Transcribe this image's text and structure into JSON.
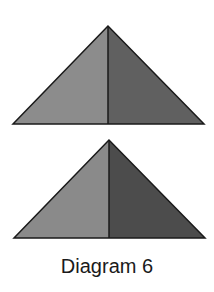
{
  "caption": "Diagram 6",
  "colors": {
    "background": "#ffffff",
    "outline": "#1a1a1a",
    "top_left_face": "#8c8c8c",
    "top_right_face": "#606060",
    "bottom_left_face": "#8a8a8a",
    "bottom_right_face": "#4c4c4c"
  },
  "shapes": [
    {
      "name": "top-triangle",
      "apex": [
        108,
        26
      ],
      "left": [
        13,
        124
      ],
      "right": [
        204,
        124
      ]
    },
    {
      "name": "bottom-triangle",
      "apex": [
        109,
        140
      ],
      "left": [
        14,
        238
      ],
      "right": [
        205,
        238
      ]
    }
  ]
}
